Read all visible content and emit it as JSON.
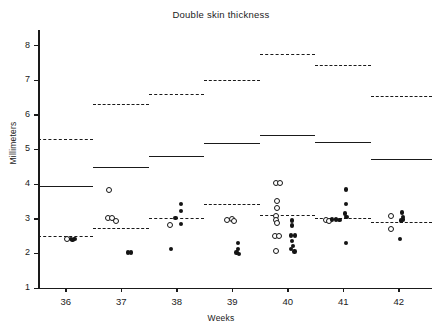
{
  "figure": {
    "title": "Double skin thickness",
    "background_color": "#ffffff",
    "ink_color": "#1a1a1a"
  },
  "axes": {
    "y_axis_title": "Millimeters",
    "x_axis_title": "Weeks",
    "y_ticks": [
      8,
      7,
      6,
      5,
      4,
      3,
      2,
      1
    ],
    "y_tick_labels": [
      "8",
      "7",
      "6",
      "5",
      "4",
      "3",
      "2",
      "1"
    ],
    "y_min": 1,
    "y_max": 8.45,
    "x_ticks": [
      36,
      37,
      38,
      39,
      40,
      41,
      42
    ],
    "x_tick_labels": [
      "36",
      "37",
      "38",
      "39",
      "40",
      "41",
      "42"
    ],
    "x_min": 35.5,
    "x_max": 42.6
  },
  "chart_data": {
    "type": "scatter",
    "title": "Double skin thickness",
    "xlabel": "Weeks",
    "ylabel": "Millimeters",
    "xlim": [
      35.5,
      42.6
    ],
    "ylim": [
      1,
      8.45
    ],
    "grid": false,
    "legend": null,
    "categories": [
      "36",
      "37",
      "38",
      "39",
      "40",
      "41",
      "42"
    ],
    "reference_lines": [
      {
        "week": 36,
        "x_start": 35.5,
        "x_end": 36.5,
        "mean": 2.5,
        "solid_upper": 3.95,
        "dashed_upper": 5.3
      },
      {
        "week": 37,
        "x_start": 36.5,
        "x_end": 37.5,
        "mean": 2.72,
        "solid_upper": 4.5,
        "dashed_upper": 6.3
      },
      {
        "week": 38,
        "x_start": 37.5,
        "x_end": 38.5,
        "mean": 3.03,
        "solid_upper": 4.82,
        "dashed_upper": 6.6
      },
      {
        "week": 39,
        "x_start": 38.5,
        "x_end": 39.5,
        "mean": 3.43,
        "solid_upper": 5.2,
        "dashed_upper": 7.0
      },
      {
        "week": 40,
        "x_start": 39.5,
        "x_end": 40.5,
        "mean": 3.12,
        "solid_upper": 5.42,
        "dashed_upper": 7.75
      },
      {
        "week": 41,
        "x_start": 40.5,
        "x_end": 41.5,
        "mean": 3.02,
        "solid_upper": 5.22,
        "dashed_upper": 7.45
      },
      {
        "week": 42,
        "x_start": 41.5,
        "x_end": 42.6,
        "mean": 2.92,
        "solid_upper": 4.72,
        "dashed_upper": 6.55
      }
    ],
    "series": [
      {
        "name": "open-circle-observations",
        "marker": "open-circle",
        "points": [
          {
            "x": 36.02,
            "y": 2.43
          },
          {
            "x": 36.78,
            "y": 3.85
          },
          {
            "x": 36.75,
            "y": 3.02
          },
          {
            "x": 36.83,
            "y": 3.02
          },
          {
            "x": 36.9,
            "y": 2.95
          },
          {
            "x": 37.88,
            "y": 2.83
          },
          {
            "x": 38.9,
            "y": 2.98
          },
          {
            "x": 38.98,
            "y": 3.0
          },
          {
            "x": 39.03,
            "y": 2.95
          },
          {
            "x": 39.78,
            "y": 4.05
          },
          {
            "x": 39.86,
            "y": 4.05
          },
          {
            "x": 39.8,
            "y": 3.52
          },
          {
            "x": 39.8,
            "y": 3.32
          },
          {
            "x": 39.79,
            "y": 3.1
          },
          {
            "x": 39.79,
            "y": 2.98
          },
          {
            "x": 39.8,
            "y": 2.88
          },
          {
            "x": 39.76,
            "y": 2.52
          },
          {
            "x": 39.83,
            "y": 2.52
          },
          {
            "x": 39.79,
            "y": 2.08
          },
          {
            "x": 40.68,
            "y": 2.98
          },
          {
            "x": 40.74,
            "y": 2.96
          },
          {
            "x": 41.86,
            "y": 3.1
          },
          {
            "x": 41.86,
            "y": 2.72
          }
        ]
      },
      {
        "name": "filled-dot-observations",
        "marker": "filled-circle",
        "points": [
          {
            "x": 36.1,
            "y": 2.42
          },
          {
            "x": 36.16,
            "y": 2.42
          },
          {
            "x": 36.12,
            "y": 2.38
          },
          {
            "x": 37.12,
            "y": 2.02
          },
          {
            "x": 37.18,
            "y": 2.02
          },
          {
            "x": 38.08,
            "y": 3.42
          },
          {
            "x": 38.08,
            "y": 3.22
          },
          {
            "x": 37.98,
            "y": 3.02
          },
          {
            "x": 38.08,
            "y": 2.85
          },
          {
            "x": 37.9,
            "y": 2.13
          },
          {
            "x": 39.1,
            "y": 2.3
          },
          {
            "x": 39.1,
            "y": 2.12
          },
          {
            "x": 39.08,
            "y": 2.02
          },
          {
            "x": 39.12,
            "y": 1.98
          },
          {
            "x": 40.08,
            "y": 2.95
          },
          {
            "x": 40.08,
            "y": 2.8
          },
          {
            "x": 40.06,
            "y": 2.52
          },
          {
            "x": 40.13,
            "y": 2.52
          },
          {
            "x": 40.08,
            "y": 2.35
          },
          {
            "x": 40.1,
            "y": 2.22
          },
          {
            "x": 40.06,
            "y": 2.12
          },
          {
            "x": 40.12,
            "y": 2.05
          },
          {
            "x": 41.05,
            "y": 3.85
          },
          {
            "x": 41.05,
            "y": 3.42
          },
          {
            "x": 41.03,
            "y": 3.15
          },
          {
            "x": 41.06,
            "y": 3.05
          },
          {
            "x": 40.8,
            "y": 2.98
          },
          {
            "x": 40.87,
            "y": 2.98
          },
          {
            "x": 40.93,
            "y": 2.96
          },
          {
            "x": 41.05,
            "y": 2.3
          },
          {
            "x": 42.06,
            "y": 3.18
          },
          {
            "x": 42.08,
            "y": 3.05
          },
          {
            "x": 42.08,
            "y": 2.98
          },
          {
            "x": 42.04,
            "y": 2.95
          },
          {
            "x": 42.02,
            "y": 2.42
          }
        ]
      }
    ]
  }
}
